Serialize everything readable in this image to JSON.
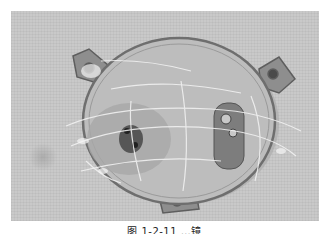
{
  "figure": {
    "colors": {
      "background": "#c9c9c9",
      "object_fill": "#bdbdbd",
      "object_rim": "#6e6e6e",
      "film_highlight": "#f2f2f2",
      "dark_spot": "#3a3a3a"
    }
  },
  "caption": {
    "text": "图 1-2-11  …镜"
  }
}
